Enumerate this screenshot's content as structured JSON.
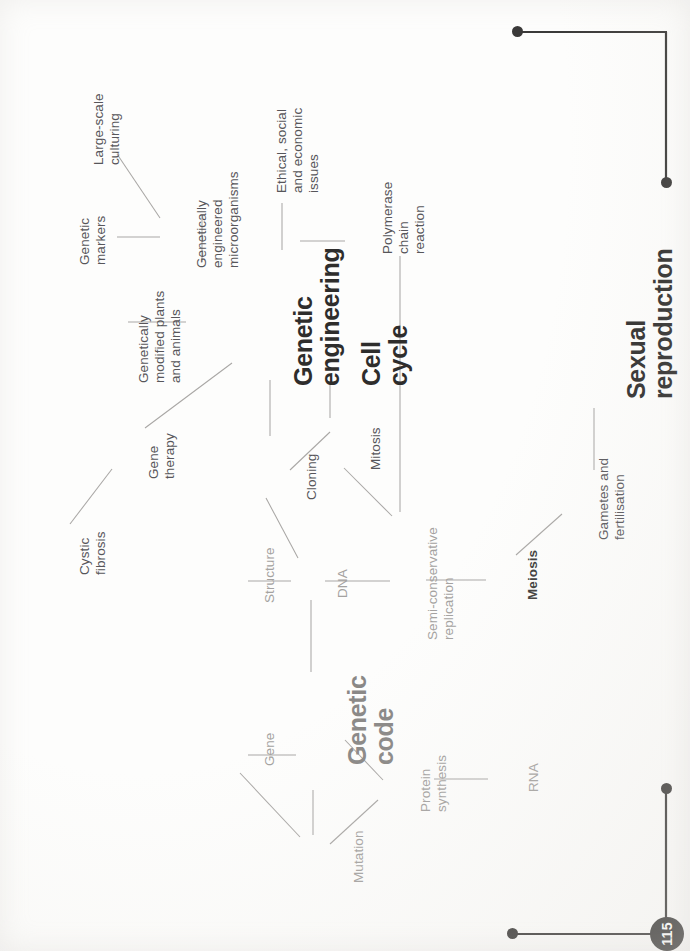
{
  "page": {
    "number": "115",
    "orientation": "rotated-90-ccw",
    "background_color": "#fdfdfc",
    "ink_color": "#2e2d2c",
    "connector_color": "#a9a7a5"
  },
  "mindmap": {
    "title": "Genetics and cell division revision mind map",
    "nodes": [
      {
        "id": "genetic-engineering",
        "label": "Genetic\nengineering",
        "level": "main",
        "tone": "dark"
      },
      {
        "id": "cell-cycle",
        "label": "Cell\ncycle",
        "level": "main",
        "tone": "dark"
      },
      {
        "id": "sexual-reproduction",
        "label": "Sexual\nreproduction",
        "level": "main",
        "tone": "dark"
      },
      {
        "id": "genetic-code",
        "label": "Genetic\ncode",
        "level": "main",
        "tone": "gray"
      },
      {
        "id": "large-scale-culturing",
        "label": "Large-scale\nculturing",
        "level": "sub",
        "tone": "mid"
      },
      {
        "id": "genetic-markers",
        "label": "Genetic\nmarkers",
        "level": "sub",
        "tone": "mid"
      },
      {
        "id": "genetically-engineered-micro",
        "label": "Genetically\nengineered\nmicroorganisms",
        "level": "sub",
        "tone": "mid"
      },
      {
        "id": "ethical-social-economic",
        "label": "Ethical, social\nand economic\nissues",
        "level": "sub",
        "tone": "mid"
      },
      {
        "id": "polymerase-chain-reaction",
        "label": "Polymerase\nchain\nreaction",
        "level": "sub",
        "tone": "mid"
      },
      {
        "id": "genetically-modified-plants",
        "label": "Genetically\nmodified plants\nand animals",
        "level": "sub",
        "tone": "mid"
      },
      {
        "id": "gene-therapy",
        "label": "Gene\ntherapy",
        "level": "sub",
        "tone": "mid"
      },
      {
        "id": "cystic-fibrosis",
        "label": "Cystic\nfibrosis",
        "level": "sub",
        "tone": "mid"
      },
      {
        "id": "cloning",
        "label": "Cloning",
        "level": "sub",
        "tone": "mid"
      },
      {
        "id": "mitosis",
        "label": "Mitosis",
        "level": "sub",
        "tone": "mid"
      },
      {
        "id": "structure",
        "label": "Structure",
        "level": "sub",
        "tone": "light"
      },
      {
        "id": "dna",
        "label": "DNA",
        "level": "sub",
        "tone": "light"
      },
      {
        "id": "semi-conservative-replication",
        "label": "Semi-conservative\nreplication",
        "level": "sub",
        "tone": "light"
      },
      {
        "id": "meiosis",
        "label": "Meiosis",
        "level": "sub",
        "tone": "bold"
      },
      {
        "id": "gametes-and-fertilisation",
        "label": "Gametes and\nfertilisation",
        "level": "sub",
        "tone": "mid"
      },
      {
        "id": "gene",
        "label": "Gene",
        "level": "sub",
        "tone": "light"
      },
      {
        "id": "mutation",
        "label": "Mutation",
        "level": "sub",
        "tone": "light"
      },
      {
        "id": "protein-synthesis",
        "label": "Protein\nsynthesis",
        "level": "sub",
        "tone": "light"
      },
      {
        "id": "rna",
        "label": "RNA",
        "level": "sub",
        "tone": "light"
      }
    ],
    "connections": [
      {
        "from": "genetic-engineering",
        "to": "genetically-engineered-micro"
      },
      {
        "from": "genetically-engineered-micro",
        "to": "large-scale-culturing"
      },
      {
        "from": "genetically-engineered-micro",
        "to": "genetic-markers"
      },
      {
        "from": "genetic-engineering",
        "to": "ethical-social-economic"
      },
      {
        "from": "genetic-engineering",
        "to": "polymerase-chain-reaction"
      },
      {
        "from": "genetic-engineering",
        "to": "genetically-modified-plants"
      },
      {
        "from": "genetic-engineering",
        "to": "gene-therapy"
      },
      {
        "from": "gene-therapy",
        "to": "cystic-fibrosis"
      },
      {
        "from": "genetic-engineering",
        "to": "cloning"
      },
      {
        "from": "cloning",
        "to": "dna"
      },
      {
        "from": "cloning",
        "to": "mitosis"
      },
      {
        "from": "cell-cycle",
        "to": "mitosis"
      },
      {
        "from": "cell-cycle",
        "to": "polymerase-chain-reaction"
      },
      {
        "from": "mitosis",
        "to": "semi-conservative-replication"
      },
      {
        "from": "dna",
        "to": "structure"
      },
      {
        "from": "dna",
        "to": "semi-conservative-replication"
      },
      {
        "from": "dna",
        "to": "genetic-code"
      },
      {
        "from": "semi-conservative-replication",
        "to": "meiosis"
      },
      {
        "from": "meiosis",
        "to": "gametes-and-fertilisation"
      },
      {
        "from": "gametes-and-fertilisation",
        "to": "sexual-reproduction"
      },
      {
        "from": "genetic-code",
        "to": "gene"
      },
      {
        "from": "gene",
        "to": "mutation"
      },
      {
        "from": "genetic-code",
        "to": "mutation"
      },
      {
        "from": "genetic-code",
        "to": "protein-synthesis"
      },
      {
        "from": "mutation",
        "to": "protein-synthesis"
      },
      {
        "from": "protein-synthesis",
        "to": "rna"
      }
    ]
  },
  "decoration": {
    "top_rule_name": "corner-rule-top-right",
    "bottom_rule_name": "corner-rule-bottom-right"
  }
}
